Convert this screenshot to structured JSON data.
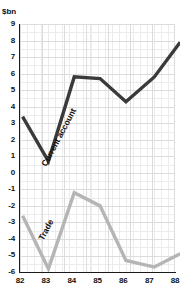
{
  "chart_data": {
    "type": "line",
    "title": "",
    "subtitle": "",
    "xlabel": "",
    "ylabel": "$bn",
    "unit_label": "$bn",
    "grid": true,
    "legend_position": "inline",
    "xlim": [
      82,
      88
    ],
    "ylim": [
      -6,
      9
    ],
    "x": [
      82,
      83,
      84,
      85,
      86,
      87,
      88
    ],
    "xticklabels": [
      "82",
      "83",
      "84",
      "85",
      "86",
      "87",
      "88"
    ],
    "yticklabels": [
      "9",
      "8",
      "7",
      "6",
      "5",
      "4",
      "3",
      "2",
      "1",
      "0",
      "-1",
      "-2",
      "-3",
      "-4",
      "-5",
      "-6"
    ],
    "yticks": [
      9,
      8,
      7,
      6,
      5,
      4,
      3,
      2,
      1,
      0,
      -1,
      -2,
      -3,
      -4,
      -5,
      -6
    ],
    "series": [
      {
        "name": "Current account",
        "color": "#3a3a3a",
        "x": [
          82.1,
          83.1,
          84.1,
          85.1,
          86.1,
          87.2,
          88.2
        ],
        "values": [
          3.4,
          0.7,
          5.8,
          5.7,
          4.3,
          5.8,
          7.9
        ]
      },
      {
        "name": "Trade",
        "color": "#b5b5b5",
        "x": [
          82.1,
          83.1,
          84.1,
          85.1,
          86.1,
          87.2,
          88.2
        ],
        "values": [
          -2.6,
          -5.8,
          -1.2,
          -2.0,
          -5.3,
          -5.7,
          -4.9
        ]
      }
    ],
    "annotations": [
      {
        "text": "Current account",
        "series": "Current account"
      },
      {
        "text": "Trade",
        "series": "Trade"
      }
    ]
  }
}
